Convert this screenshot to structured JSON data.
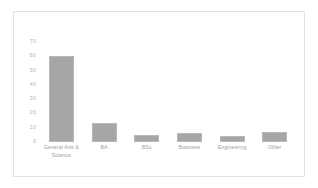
{
  "chart_data": {
    "type": "bar",
    "title": "",
    "xlabel": "",
    "ylabel": "",
    "categories": [
      "General Arts & Science",
      "BA",
      "BSc",
      "Business",
      "Engineering",
      "Other"
    ],
    "values": [
      60,
      13,
      5,
      6,
      4.5,
      7
    ],
    "ylim": [
      0,
      70
    ],
    "yticks": [
      70,
      60,
      50,
      40,
      30,
      20,
      10,
      0
    ],
    "ytick_labels": [
      "70",
      "60",
      "50",
      "40",
      "30",
      "20",
      "10",
      "0"
    ],
    "grid": false,
    "legend": false,
    "bar_color": "#a6a6a6",
    "bar_edge_color": "#b8b8b8",
    "axis_label_color": "#9c9c9c",
    "frame_border_color": "#e2e2e2",
    "background_color": "#ffffff"
  }
}
